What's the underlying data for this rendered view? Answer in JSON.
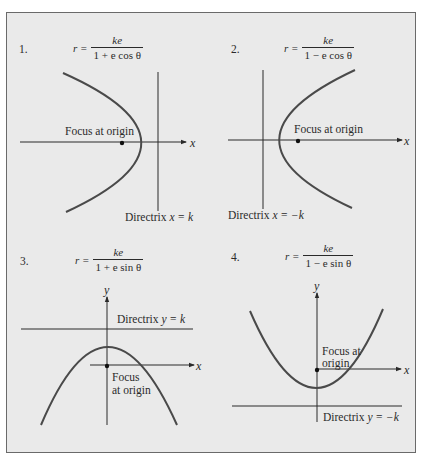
{
  "panels": [
    {
      "number": "1.",
      "formula": {
        "lhs": "r =",
        "numerator": "ke",
        "denominator": "1 + e cos θ"
      },
      "focus_label": "Focus at origin",
      "directrix_prefix": "Directrix ",
      "directrix_eq": "x = k",
      "axis_label": "x",
      "orientation": "opens-left, directrix right of focus"
    },
    {
      "number": "2.",
      "formula": {
        "lhs": "r =",
        "numerator": "ke",
        "denominator": "1 − e cos θ"
      },
      "focus_label": "Focus at origin",
      "directrix_prefix": "Directrix ",
      "directrix_eq": "x = −k",
      "axis_label": "x",
      "orientation": "opens-right, directrix left of focus"
    },
    {
      "number": "3.",
      "formula": {
        "lhs": "r =",
        "numerator": "ke",
        "denominator": "1 + e sin θ"
      },
      "focus_label_line1": "Focus",
      "focus_label_line2": "at origin",
      "directrix_prefix": "Directrix ",
      "directrix_eq": "y = k",
      "axis_label_x": "x",
      "axis_label_y": "y",
      "orientation": "opens-down, directrix above focus"
    },
    {
      "number": "4.",
      "formula": {
        "lhs": "r =",
        "numerator": "ke",
        "denominator": "1 − e sin θ"
      },
      "focus_label_line1": "Focus at",
      "focus_label_line2": "origin",
      "directrix_prefix": "Directrix ",
      "directrix_eq": "y = −k",
      "axis_label_x": "x",
      "axis_label_y": "y",
      "orientation": "opens-up, directrix below focus"
    }
  ],
  "colors": {
    "background": "#eaeaea",
    "curve": "#4a4a4a",
    "lines": "#3a3a3a",
    "border": "#6a6a6a"
  }
}
